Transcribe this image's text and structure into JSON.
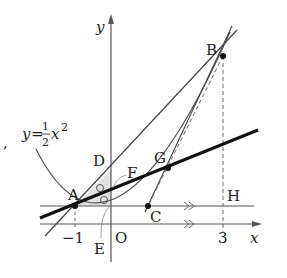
{
  "diagram": {
    "equation": {
      "y": "y",
      "eq": "=",
      "num": "1",
      "den": "2",
      "x": "x",
      "exp": "2"
    },
    "axes": {
      "x_label": "x",
      "y_label": "y",
      "origin": "O"
    },
    "ticks": {
      "neg1": "−1",
      "three": "3"
    },
    "points": {
      "A": "A",
      "B": "B",
      "C": "C",
      "D": "D",
      "E": "E",
      "F": "F",
      "G": "G",
      "H": "H"
    },
    "comma": ","
  }
}
